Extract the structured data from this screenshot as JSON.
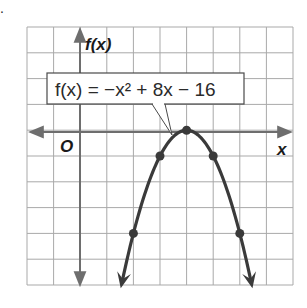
{
  "chart_data": {
    "type": "line",
    "title": "",
    "equation_label": "f(x) = −x² + 8x − 16",
    "xlabel": "x",
    "ylabel": "f(x)",
    "origin_label": "O",
    "xlim": [
      -2,
      8
    ],
    "ylim": [
      -6,
      4
    ],
    "grid": true,
    "legend_position": "callout",
    "function": "-x^2 + 8x - 16",
    "series": [
      {
        "name": "f(x) = -x^2 + 8x - 16",
        "marked_points": [
          {
            "x": 2,
            "y": -4
          },
          {
            "x": 3,
            "y": -1
          },
          {
            "x": 4,
            "y": 0
          },
          {
            "x": 5,
            "y": -1
          },
          {
            "x": 6,
            "y": -4
          }
        ],
        "vertex": {
          "x": 4,
          "y": 0
        },
        "arrows": "both-ends-down"
      }
    ]
  },
  "colors": {
    "grid": "#a9a9a9",
    "axis": "#6e6e6e",
    "curve": "#3a3a3a",
    "text": "#1a1a1a",
    "background": "#ffffff"
  },
  "marker": "."
}
